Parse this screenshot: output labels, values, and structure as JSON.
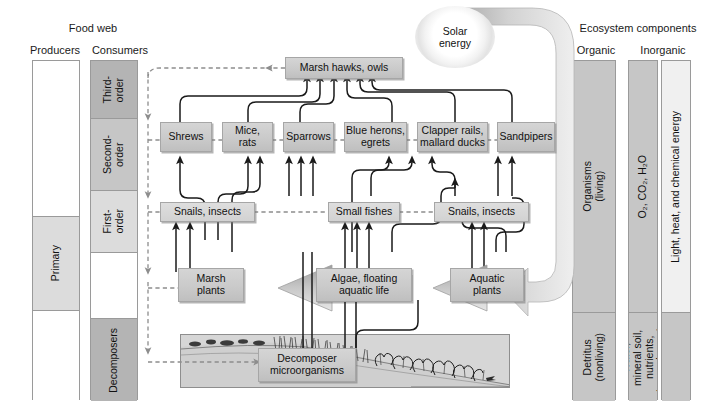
{
  "headers": {
    "food_web": "Food web",
    "producers": "Producers",
    "consumers": "Consumers",
    "ecosystem_components": "Ecosystem components",
    "organic": "Organic",
    "inorganic": "Inorganic"
  },
  "producers_bar": {
    "segments": [
      {
        "label": "",
        "shade": "white"
      },
      {
        "label": "Primary",
        "shade": "light"
      },
      {
        "label": "",
        "shade": "white"
      }
    ]
  },
  "consumers_bar": {
    "segments": [
      {
        "label": "Third-\norder",
        "shade": "dark"
      },
      {
        "label": "Second-\norder",
        "shade": "mid"
      },
      {
        "label": "First-\norder",
        "shade": "light"
      },
      {
        "label": "",
        "shade": "white"
      },
      {
        "label": "Decomposers",
        "shade": "dark"
      }
    ]
  },
  "organic_bar": {
    "segments": [
      {
        "label": "Organisms\n(living)",
        "shade": "mid"
      },
      {
        "label": "Detritus\n(nonliving)",
        "shade": "mid"
      }
    ]
  },
  "inorganic_bar": {
    "left_segments": [
      {
        "label": "O₂, CO₂, H₂O",
        "shade": "mid"
      },
      {
        "label": "Water,\nmineral soil,\nnutrients,\ntrace elements",
        "shade": "mid"
      }
    ],
    "right_segments": [
      {
        "label": "Light, heat, and chemical energy",
        "shade": "pale"
      },
      {
        "label": "",
        "shade": "mid"
      }
    ]
  },
  "solar": {
    "label": "Solar\nenergy"
  },
  "food_web": {
    "third_order": [
      {
        "id": "marsh-hawks-owls",
        "label": "Marsh hawks, owls"
      }
    ],
    "second_order": [
      {
        "id": "shrews",
        "label": "Shrews"
      },
      {
        "id": "mice-rats",
        "label": "Mice,\nrats"
      },
      {
        "id": "sparrows",
        "label": "Sparrows"
      },
      {
        "id": "blue-herons-egrets",
        "label": "Blue herons,\negrets"
      },
      {
        "id": "clapper-rails-mallard-ducks",
        "label": "Clapper rails,\nmallard ducks"
      },
      {
        "id": "sandpipers",
        "label": "Sandpipers"
      }
    ],
    "first_order": [
      {
        "id": "snails-insects-left",
        "label": "Snails, insects"
      },
      {
        "id": "small-fishes",
        "label": "Small fishes"
      },
      {
        "id": "snails-insects-right",
        "label": "Snails, insects"
      }
    ],
    "producers": [
      {
        "id": "marsh-plants",
        "label": "Marsh\nplants"
      },
      {
        "id": "algae-floating-aquatic-life",
        "label": "Algae, floating\naquatic life"
      },
      {
        "id": "aquatic-plants",
        "label": "Aquatic\nplants"
      }
    ],
    "decomposers": [
      {
        "id": "decomposer-microorganisms",
        "label": "Decomposer\nmicroorganisms"
      }
    ]
  },
  "colors": {
    "box_fill": "#cccccc",
    "bar_dark": "#b4b4b4",
    "bar_mid": "#c6c6c6",
    "bar_light": "#dcdcdc",
    "bar_pale": "#f0f0f0",
    "bar_white": "#ffffff",
    "solid_arrow": "#1a1a1a",
    "dashed_arrow": "#8d8d8d",
    "energy_flow": "#c3c3c3"
  }
}
